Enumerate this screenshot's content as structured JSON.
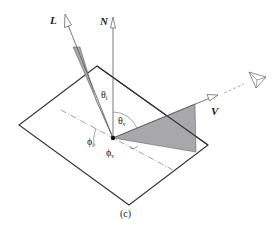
{
  "figure": {
    "caption": "(c)",
    "vectors": {
      "light": {
        "label": "L"
      },
      "normal": {
        "label": "N"
      },
      "view": {
        "label": "V"
      }
    },
    "angles": {
      "theta_i": {
        "symbol": "θ",
        "subscript": "i"
      },
      "theta_v": {
        "symbol": "θ",
        "subscript": "v"
      },
      "phi_i": {
        "symbol": "ϕ",
        "subscript": "i"
      },
      "phi_v": {
        "symbol": "ϕ",
        "subscript": "v"
      }
    },
    "icons": {
      "eye": "eye-icon"
    },
    "colors": {
      "line": "#333333",
      "shade": "#a8a8ac",
      "background": "#ffffff"
    }
  }
}
